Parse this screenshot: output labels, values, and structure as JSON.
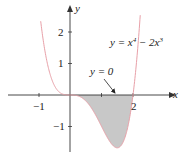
{
  "chart_data": {
    "type": "area",
    "title": "",
    "function": "y = x^4 - 2x^3",
    "xlabel": "x",
    "ylabel": "y",
    "xlim": [
      -2.1,
      3.4
    ],
    "ylim": [
      -2.0,
      3.0
    ],
    "xticks": [
      -1,
      1,
      2
    ],
    "xtick_labels": [
      "-1",
      "",
      "2"
    ],
    "yticks": [
      -1,
      1,
      2
    ],
    "ytick_labels": [
      "-1",
      "1",
      "2"
    ],
    "grid": false,
    "series": [
      {
        "name": "y = x^4 - 2x^3",
        "x": [
          -0.9,
          -0.5,
          0,
          0.5,
          1,
          1.5,
          2,
          2.2
        ],
        "values": [
          2.11,
          0.31,
          0,
          -0.19,
          -1,
          -1.69,
          0,
          1.13
        ],
        "color": "#e8a0a8"
      }
    ],
    "shaded_region": {
      "from_x": 0,
      "to_x": 2,
      "between": [
        "y = x^4 - 2x^3",
        "y = 0"
      ],
      "color": "#c8c8c8"
    },
    "annotations": [
      {
        "text": "y = x^4 - 2x^3",
        "label_x": 1.9,
        "label_y": 1.7
      },
      {
        "text": "y = 0",
        "label_x": 1.0,
        "label_y": 0.55,
        "arrow_to": [
          1.45,
          0
        ]
      }
    ]
  },
  "labels": {
    "x_axis": "x",
    "y_axis": "y",
    "tick_neg1_x": "−1",
    "tick_2_x": "2",
    "tick_1_y": "1",
    "tick_2_y": "2",
    "tick_neg1_y": "−1",
    "curve_label_pre": "y = x",
    "curve_label_exp1": "4",
    "curve_label_mid": " − 2x",
    "curve_label_exp2": "3",
    "zero_label": "y = 0"
  }
}
